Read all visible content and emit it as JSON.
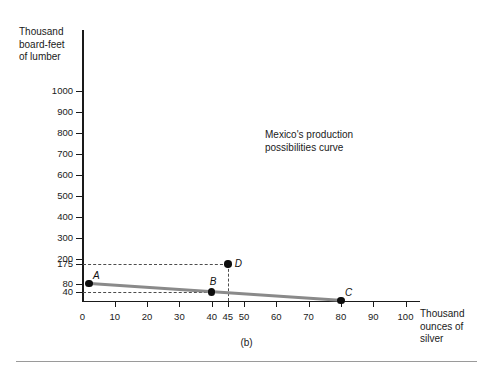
{
  "chart_data": {
    "type": "line",
    "title": "",
    "subtitle": "",
    "xlabel": "Thousand ounces of silver",
    "ylabel": "Thousand board-feet of lumber",
    "xlim": [
      0,
      105
    ],
    "ylim": [
      0,
      1050
    ],
    "grid": false,
    "legend": null,
    "annotations": [
      {
        "id": "ppc-annotation",
        "text_line1": "Mexico's production",
        "text_line2": "possibilities curve",
        "x": 62,
        "y": 640
      }
    ],
    "series": [
      {
        "name": "Mexico's production possibilities curve",
        "color": "#8a8a8a",
        "x": [
          2,
          80
        ],
        "y": [
          80,
          0
        ]
      }
    ],
    "points": [
      {
        "label": "A",
        "x": 2,
        "y": 80,
        "label_pos": "above-right"
      },
      {
        "label": "B",
        "x": 40,
        "y": 40,
        "label_pos": "above"
      },
      {
        "label": "C",
        "x": 80,
        "y": 0,
        "label_pos": "above-right"
      },
      {
        "label": "D",
        "x": 45,
        "y": 175,
        "label_pos": "right"
      }
    ],
    "guides": [
      {
        "type": "horizontal",
        "value": 175,
        "from_x": 0,
        "to_x": 45
      },
      {
        "type": "horizontal",
        "value": 40,
        "from_x": 0,
        "to_x": 40
      },
      {
        "type": "vertical",
        "value": 45,
        "from_y": 0,
        "to_y": 175
      }
    ],
    "yticks": [
      {
        "value": 1000,
        "label": "1000"
      },
      {
        "value": 900,
        "label": "900"
      },
      {
        "value": 800,
        "label": "800"
      },
      {
        "value": 700,
        "label": "700"
      },
      {
        "value": 600,
        "label": "600"
      },
      {
        "value": 500,
        "label": "500"
      },
      {
        "value": 400,
        "label": "400"
      },
      {
        "value": 300,
        "label": "300"
      },
      {
        "value": 200,
        "label": "200"
      },
      {
        "value": 175,
        "label": "175"
      },
      {
        "value": 80,
        "label": "80"
      },
      {
        "value": 40,
        "label": "40"
      }
    ],
    "xticks": [
      {
        "value": 0,
        "label": "0"
      },
      {
        "value": 10,
        "label": "10"
      },
      {
        "value": 20,
        "label": "20"
      },
      {
        "value": 30,
        "label": "30"
      },
      {
        "value": 40,
        "label": "40"
      },
      {
        "value": 45,
        "label": "45"
      },
      {
        "value": 50,
        "label": "50"
      },
      {
        "value": 60,
        "label": "60"
      },
      {
        "value": 70,
        "label": "70"
      },
      {
        "value": 80,
        "label": "80"
      },
      {
        "value": 90,
        "label": "90"
      },
      {
        "value": 100,
        "label": "100"
      }
    ]
  },
  "figure": {
    "ylabel_line1": "Thousand",
    "ylabel_line2": "board-feet",
    "ylabel_line3": "of lumber",
    "xlabel_line1": "Thousand",
    "xlabel_line2": "ounces of",
    "xlabel_line3": "silver",
    "annotation_line1": "Mexico's production",
    "annotation_line2": "possibilities curve",
    "caption": "(b)"
  }
}
